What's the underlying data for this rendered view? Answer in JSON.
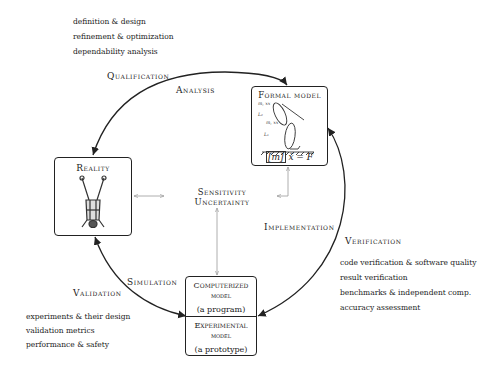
{
  "design_list": [
    "definition & design",
    "refinement & optimization",
    "dependability analysis"
  ],
  "labels": {
    "qualification": "Qualification",
    "analysis": "Analysis",
    "implementation": "Implementation",
    "verification": "Verification",
    "simulation": "Simulation",
    "validation": "Validation"
  },
  "verification_list": [
    "code verification & software quality",
    "result verification",
    "benchmarks & independent comp.",
    "accuracy assessment"
  ],
  "validation_list": [
    "experiments & their design",
    "validation metrics",
    "performance & safety"
  ],
  "boxes": {
    "reality": {
      "title": "Reality",
      "icon": "upside-down-person-illustration"
    },
    "formal_model": {
      "title": "Formal model",
      "equation_m": "[m]",
      "equation_rest": " ẍ = F",
      "icon": "biomechanical-model-illustration",
      "annotations": [
        "m, xx",
        "L₂",
        "m, xx",
        "L₁"
      ]
    },
    "computerized": {
      "title_line1": "Computerized",
      "title_line2": "model",
      "subtitle": "(a program)"
    },
    "experimental": {
      "title_line1": "Experimental",
      "title_line2": "model",
      "subtitle": "(a prototype)"
    }
  },
  "center": {
    "line1": "Sensitivity",
    "line2": "Uncertainty"
  },
  "colors": {
    "line": "#222222",
    "connector": "#9a9a9a"
  }
}
